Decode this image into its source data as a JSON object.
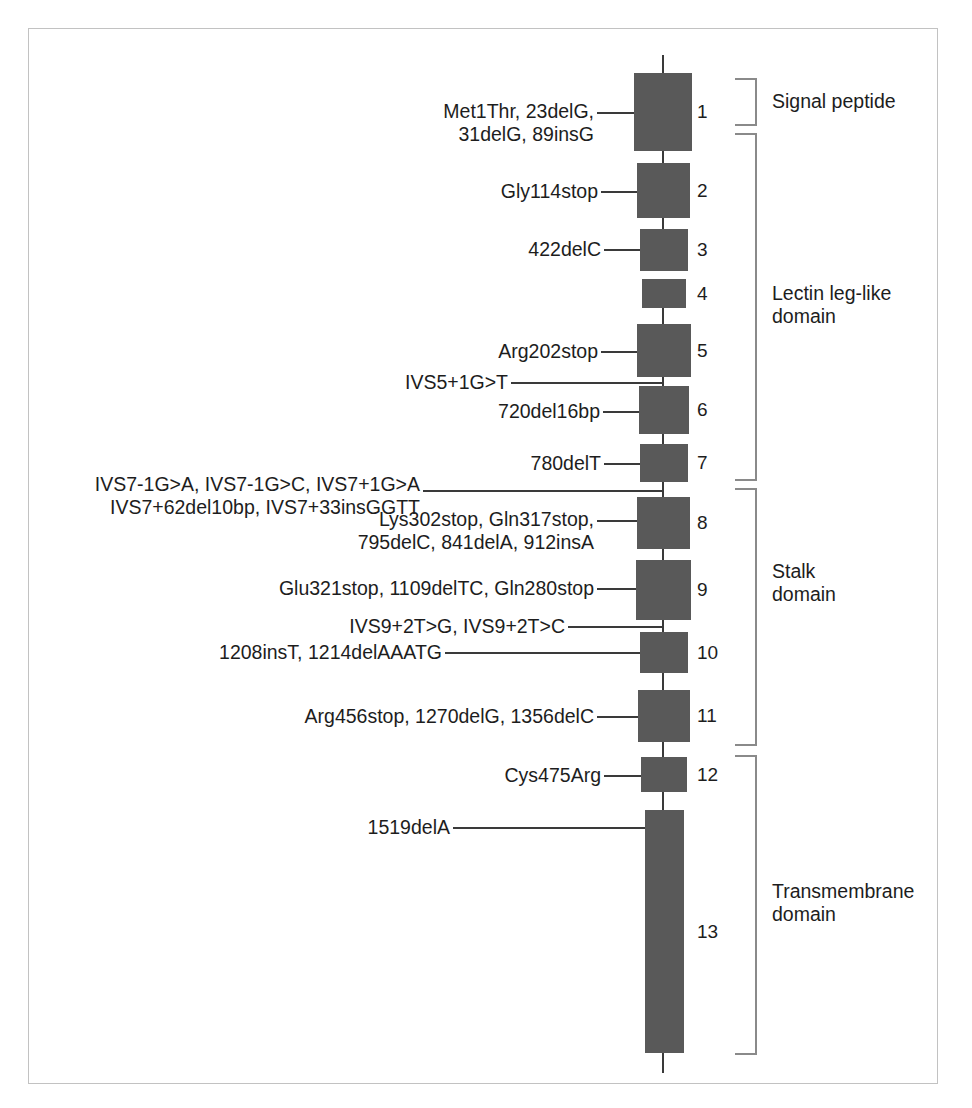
{
  "figure": {
    "type": "gene-exon-structure-diagram",
    "background_color": "#ffffff",
    "frame_color": "#c2c2c2",
    "exon_fill_color": "#595959",
    "line_color": "#3a3a3a",
    "bracket_color": "#8a8a8a",
    "text_color": "#1d1d1d"
  },
  "exons": [
    {
      "number": "1",
      "x": 634,
      "y": 73,
      "w": 58,
      "h": 78
    },
    {
      "number": "2",
      "x": 637,
      "y": 163,
      "w": 53,
      "h": 55
    },
    {
      "number": "3",
      "x": 640,
      "y": 229,
      "w": 48,
      "h": 42
    },
    {
      "number": "4",
      "x": 642,
      "y": 279,
      "w": 44,
      "h": 29
    },
    {
      "number": "5",
      "x": 637,
      "y": 324,
      "w": 54,
      "h": 53
    },
    {
      "number": "6",
      "x": 639,
      "y": 386,
      "w": 50,
      "h": 48
    },
    {
      "number": "7",
      "x": 640,
      "y": 444,
      "w": 48,
      "h": 38
    },
    {
      "number": "8",
      "x": 637,
      "y": 497,
      "w": 53,
      "h": 52
    },
    {
      "number": "9",
      "x": 636,
      "y": 560,
      "w": 55,
      "h": 60
    },
    {
      "number": "10",
      "x": 640,
      "y": 632,
      "w": 48,
      "h": 41
    },
    {
      "number": "11",
      "x": 638,
      "y": 690,
      "w": 52,
      "h": 52
    },
    {
      "number": "12",
      "x": 641,
      "y": 757,
      "w": 46,
      "h": 35
    },
    {
      "number": "13",
      "x": 645,
      "y": 810,
      "w": 39,
      "h": 243
    }
  ],
  "mutation_labels": [
    {
      "id": "exon1-mutations",
      "text": "Met1Thr, 23delG,\n31delG, 89insG",
      "lines": 2,
      "right_edge": 594,
      "top": 100,
      "leader": {
        "x": 597,
        "y": 112,
        "length": 37
      }
    },
    {
      "id": "exon2-mutations",
      "text": "Gly114stop",
      "lines": 1,
      "right_edge": 598,
      "top": 180,
      "leader": {
        "x": 601,
        "y": 191,
        "length": 36
      }
    },
    {
      "id": "exon3-mutations",
      "text": "422delC",
      "lines": 1,
      "right_edge": 601,
      "top": 238,
      "leader": {
        "x": 604,
        "y": 249,
        "length": 36
      }
    },
    {
      "id": "exon5-mutations",
      "text": "Arg202stop",
      "lines": 1,
      "right_edge": 598,
      "top": 340,
      "leader": {
        "x": 601,
        "y": 351,
        "length": 36
      }
    },
    {
      "id": "ivs5-mutations",
      "text": "IVS5+1G>T",
      "lines": 1,
      "right_edge": 508,
      "top": 371,
      "leader": {
        "x": 511,
        "y": 382,
        "length": 152
      }
    },
    {
      "id": "exon6-mutations",
      "text": "720del16bp",
      "lines": 1,
      "right_edge": 600,
      "top": 400,
      "leader": {
        "x": 603,
        "y": 411,
        "length": 36
      }
    },
    {
      "id": "exon7-mutations",
      "text": "780delT",
      "lines": 1,
      "right_edge": 601,
      "top": 452,
      "leader": {
        "x": 604,
        "y": 463,
        "length": 36
      }
    },
    {
      "id": "ivs7-mutations",
      "text": "IVS7-1G>A, IVS7-1G>C, IVS7+1G>A\nIVS7+62del10bp, IVS7+33insGGTT",
      "lines": 2,
      "right_edge": 420,
      "top": 473,
      "leader": {
        "x": 423,
        "y": 490,
        "length": 240
      }
    },
    {
      "id": "exon8-mutations",
      "text": "Lys302stop, Gln317stop,\n795delC, 841delA, 912insA",
      "lines": 2,
      "right_edge": 594,
      "top": 508,
      "leader": {
        "x": 597,
        "y": 520,
        "length": 40
      }
    },
    {
      "id": "exon9-mutations",
      "text": "Glu321stop, 1109delTC, Gln280stop",
      "lines": 1,
      "right_edge": 594,
      "top": 577,
      "leader": {
        "x": 597,
        "y": 588,
        "length": 39
      }
    },
    {
      "id": "ivs9-mutations",
      "text": "IVS9+2T>G, IVS9+2T>C",
      "lines": 1,
      "right_edge": 565,
      "top": 615,
      "leader": {
        "x": 568,
        "y": 626,
        "length": 95
      }
    },
    {
      "id": "exon10-mutations",
      "text": "1208insT, 1214delAAATG",
      "lines": 1,
      "right_edge": 442,
      "top": 641,
      "leader": {
        "x": 445,
        "y": 652,
        "length": 195
      }
    },
    {
      "id": "exon11-mutations",
      "text": "Arg456stop, 1270delG, 1356delC",
      "lines": 1,
      "right_edge": 594,
      "top": 705,
      "leader": {
        "x": 597,
        "y": 716,
        "length": 41
      }
    },
    {
      "id": "exon12-mutations",
      "text": "Cys475Arg",
      "lines": 1,
      "right_edge": 601,
      "top": 764,
      "leader": {
        "x": 604,
        "y": 775,
        "length": 37
      }
    },
    {
      "id": "exon13-mutations",
      "text": "1519delA",
      "lines": 1,
      "right_edge": 450,
      "top": 816,
      "leader": {
        "x": 453,
        "y": 827,
        "length": 192
      }
    }
  ],
  "domains": [
    {
      "id": "signal-peptide",
      "label": "Signal peptide",
      "top": 78,
      "height": 48,
      "label_top": 90
    },
    {
      "id": "lectin-leg-like-domain",
      "label": "Lectin leg-like\ndomain",
      "top": 133,
      "height": 348,
      "label_top": 282
    },
    {
      "id": "stalk-domain",
      "label": "Stalk\ndomain",
      "top": 488,
      "height": 258,
      "label_top": 560
    },
    {
      "id": "transmembrane-domain",
      "label": "Transmembrane\ndomain",
      "top": 755,
      "height": 300,
      "label_top": 880
    }
  ],
  "backbone_segments": [
    {
      "top": 55,
      "height": 20
    },
    {
      "top": 149,
      "height": 16
    },
    {
      "top": 216,
      "height": 15
    },
    {
      "top": 306,
      "height": 20
    },
    {
      "top": 375,
      "height": 13
    },
    {
      "top": 432,
      "height": 14
    },
    {
      "top": 480,
      "height": 19
    },
    {
      "top": 547,
      "height": 15
    },
    {
      "top": 618,
      "height": 16
    },
    {
      "top": 671,
      "height": 21
    },
    {
      "top": 740,
      "height": 19
    },
    {
      "top": 790,
      "height": 22
    },
    {
      "top": 1051,
      "height": 22
    }
  ]
}
